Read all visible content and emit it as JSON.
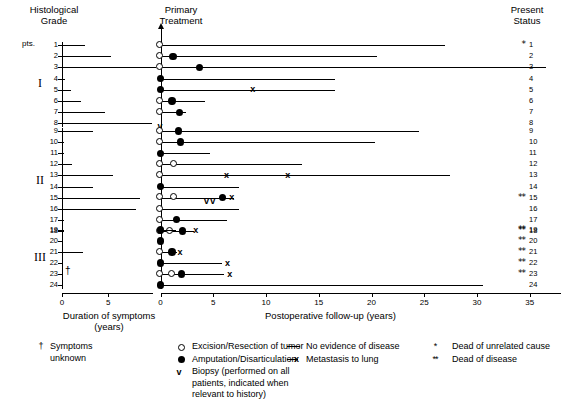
{
  "headers": {
    "histological_grade": "Histological\nGrade",
    "primary_treatment": "Primary\nTreatment",
    "present_status": "Present\nStatus"
  },
  "axes": {
    "left": {
      "title": "Duration of symptoms\n(years)",
      "ticks": [
        "0",
        "5"
      ],
      "tick_values": [
        0,
        5
      ],
      "max": 9.8,
      "unit": "years"
    },
    "bottom": {
      "title": "Postoperative follow-up (years)",
      "ticks": [
        "0",
        "5",
        "10",
        "15",
        "20",
        "25",
        "30",
        "35"
      ],
      "tick_values": [
        0,
        5,
        10,
        15,
        20,
        25,
        30,
        35
      ],
      "max": 38,
      "unit": "years"
    }
  },
  "pts_label": "pts.",
  "grades": [
    {
      "label": "I",
      "rows": [
        1,
        2,
        3,
        4,
        5,
        6,
        7,
        8
      ]
    },
    {
      "label": "II",
      "rows": [
        9,
        10,
        11,
        12,
        13,
        14,
        15,
        16,
        17,
        18
      ]
    },
    {
      "label": "III",
      "rows": [
        19,
        20,
        21,
        22,
        23,
        24
      ]
    }
  ],
  "legend": {
    "dagger": {
      "symbol": "†",
      "text": "Symptoms\nunknown"
    },
    "treatments": [
      {
        "symbol": "open-circle",
        "text": "Excision/Resection of tumor"
      },
      {
        "symbol": "filled-circle",
        "text": "Amputation/Disarticulation"
      },
      {
        "symbol": "v-glyph",
        "text": "Biopsy (performed on all\npatients, indicated when\nrelevant to history)"
      }
    ],
    "outcomes": [
      {
        "symbol": "solid-line",
        "text": "No evidence of disease"
      },
      {
        "symbol": "line-x",
        "text": "Metastasis to lung"
      }
    ],
    "status": [
      {
        "symbol": "*",
        "text": "Dead of unrelated cause"
      },
      {
        "symbol": "**",
        "text": "Dead of disease"
      }
    ]
  },
  "chart_data": {
    "type": "table",
    "xlabel": "Postoperative follow-up (years)",
    "ylabel": "Patient number",
    "xlim": [
      0,
      38
    ],
    "duration_xlim": [
      0,
      9.8
    ],
    "grid": false,
    "legend_position": "bottom",
    "patients": [
      {
        "pt": 1,
        "grade": "I",
        "duration_years": 2.5,
        "followup_years": 27.0,
        "treatments": [
          {
            "type": "open-circle",
            "year": 0.0
          }
        ],
        "metastasis_years": [],
        "status": "*",
        "symptoms_unknown": false
      },
      {
        "pt": 2,
        "grade": "I",
        "duration_years": 5.3,
        "followup_years": 20.5,
        "treatments": [
          {
            "type": "open-circle",
            "year": 0.0
          },
          {
            "type": "filled-circle",
            "year": 1.2
          }
        ],
        "metastasis_years": [],
        "status": "",
        "symptoms_unknown": false
      },
      {
        "pt": 3,
        "grade": "I",
        "duration_years": 10.2,
        "followup_years": 36.5,
        "treatments": [
          {
            "type": "open-circle",
            "year": 0.0
          },
          {
            "type": "filled-circle",
            "year": 3.7
          }
        ],
        "metastasis_years": [],
        "status": "",
        "symptoms_unknown": false
      },
      {
        "pt": 4,
        "grade": "I",
        "duration_years": 0.3,
        "followup_years": 16.5,
        "treatments": [
          {
            "type": "filled-circle",
            "year": 0.0
          }
        ],
        "metastasis_years": [],
        "status": "",
        "symptoms_unknown": false
      },
      {
        "pt": 5,
        "grade": "I",
        "duration_years": 1.0,
        "followup_years": 16.5,
        "treatments": [
          {
            "type": "filled-circle",
            "year": 0.0
          }
        ],
        "metastasis_years": [
          8.8
        ],
        "status": "",
        "symptoms_unknown": false
      },
      {
        "pt": 6,
        "grade": "I",
        "duration_years": 2.0,
        "followup_years": 4.2,
        "treatments": [
          {
            "type": "open-circle",
            "year": 0.0
          },
          {
            "type": "filled-circle",
            "year": 1.1
          }
        ],
        "metastasis_years": [],
        "status": "",
        "symptoms_unknown": false
      },
      {
        "pt": 7,
        "grade": "I",
        "duration_years": 4.6,
        "followup_years": 2.4,
        "treatments": [
          {
            "type": "open-circle",
            "year": 0.0
          },
          {
            "type": "filled-circle",
            "year": 1.8
          }
        ],
        "metastasis_years": [],
        "status": "",
        "symptoms_unknown": false
      },
      {
        "pt": 8,
        "grade": "I",
        "duration_years": 9.7,
        "followup_years": 0.0,
        "treatments": [
          {
            "type": "v-glyph",
            "year": 0.0
          }
        ],
        "metastasis_years": [],
        "status": "",
        "symptoms_unknown": false
      },
      {
        "pt": 9,
        "grade": "II",
        "duration_years": 3.3,
        "followup_years": 24.5,
        "treatments": [
          {
            "type": "open-circle",
            "year": 0.0
          },
          {
            "type": "filled-circle",
            "year": 1.7
          }
        ],
        "metastasis_years": [],
        "status": "",
        "symptoms_unknown": false
      },
      {
        "pt": 10,
        "grade": "II",
        "duration_years": 0.2,
        "followup_years": 20.3,
        "treatments": [
          {
            "type": "open-circle",
            "year": 0.0
          },
          {
            "type": "filled-circle",
            "year": 1.9
          }
        ],
        "metastasis_years": [],
        "status": "",
        "symptoms_unknown": false
      },
      {
        "pt": 11,
        "grade": "II",
        "duration_years": 0.2,
        "followup_years": 4.7,
        "treatments": [
          {
            "type": "filled-circle",
            "year": 0.0
          }
        ],
        "metastasis_years": [],
        "status": "",
        "symptoms_unknown": false
      },
      {
        "pt": 12,
        "grade": "II",
        "duration_years": 1.1,
        "followup_years": 13.4,
        "treatments": [
          {
            "type": "open-circle",
            "year": 0.0
          },
          {
            "type": "open-circle",
            "year": 1.3
          }
        ],
        "metastasis_years": [],
        "status": "",
        "symptoms_unknown": false
      },
      {
        "pt": 13,
        "grade": "II",
        "duration_years": 5.5,
        "followup_years": 27.4,
        "treatments": [
          {
            "type": "open-circle",
            "year": 0.0
          }
        ],
        "metastasis_years": [
          6.3,
          12.1
        ],
        "status": "",
        "symptoms_unknown": false
      },
      {
        "pt": 14,
        "grade": "II",
        "duration_years": 3.4,
        "followup_years": 7.4,
        "treatments": [
          {
            "type": "filled-circle",
            "year": 0.0
          }
        ],
        "metastasis_years": [],
        "status": "",
        "symptoms_unknown": false
      },
      {
        "pt": 15,
        "grade": "II",
        "duration_years": 8.4,
        "followup_years": 7.0,
        "treatments": [
          {
            "type": "open-circle",
            "year": 0.0
          },
          {
            "type": "open-circle",
            "year": 1.3
          },
          {
            "type": "v-glyph",
            "year": 4.4
          },
          {
            "type": "v-glyph",
            "year": 5.0
          },
          {
            "type": "filled-circle",
            "year": 5.9
          }
        ],
        "metastasis_years": [
          6.8
        ],
        "status": "**",
        "symptoms_unknown": false
      },
      {
        "pt": 16,
        "grade": "II",
        "duration_years": 8.0,
        "followup_years": 7.4,
        "treatments": [
          {
            "type": "open-circle",
            "year": 0.0
          }
        ],
        "metastasis_years": [],
        "status": "",
        "symptoms_unknown": false
      },
      {
        "pt": 17,
        "grade": "II",
        "duration_years": 0.2,
        "followup_years": 6.3,
        "treatments": [
          {
            "type": "open-circle",
            "year": 0.0
          },
          {
            "type": "filled-circle",
            "year": 1.5
          }
        ],
        "metastasis_years": [],
        "status": "",
        "symptoms_unknown": false
      },
      {
        "pt": 18,
        "grade": "II",
        "duration_years": 0.2,
        "followup_years": 3.2,
        "treatments": [
          {
            "type": "open-circle",
            "year": 0.0
          },
          {
            "type": "open-circle",
            "year": 0.9
          },
          {
            "type": "filled-circle",
            "year": 2.1
          }
        ],
        "metastasis_years": [
          3.4
        ],
        "status": "**",
        "symptoms_unknown": false
      },
      {
        "pt": 19,
        "grade": "III",
        "duration_years": 0.2,
        "followup_years": 1.5,
        "treatments": [
          {
            "type": "filled-circle",
            "year": 0.0
          }
        ],
        "metastasis_years": [],
        "status": "**",
        "symptoms_unknown": false
      },
      {
        "pt": 20,
        "grade": "III",
        "duration_years": 0.1,
        "followup_years": 0.0,
        "treatments": [
          {
            "type": "filled-circle",
            "year": 0.0
          }
        ],
        "metastasis_years": [],
        "status": "**",
        "symptoms_unknown": false
      },
      {
        "pt": 21,
        "grade": "III",
        "duration_years": 2.3,
        "followup_years": 1.6,
        "treatments": [
          {
            "type": "open-circle",
            "year": 0.0
          },
          {
            "type": "filled-circle",
            "year": 1.1
          }
        ],
        "metastasis_years": [
          1.9
        ],
        "status": "**",
        "symptoms_unknown": false
      },
      {
        "pt": 22,
        "grade": "III",
        "duration_years": 0.1,
        "followup_years": 5.8,
        "treatments": [
          {
            "type": "filled-circle",
            "year": 0.0
          }
        ],
        "metastasis_years": [
          6.4
        ],
        "status": "**",
        "symptoms_unknown": false
      },
      {
        "pt": 23,
        "grade": "III",
        "duration_years": 0.1,
        "followup_years": 6.0,
        "treatments": [
          {
            "type": "open-circle",
            "year": 0.0
          },
          {
            "type": "open-circle",
            "year": 1.1
          },
          {
            "type": "filled-circle",
            "year": 2.0
          }
        ],
        "metastasis_years": [
          6.6
        ],
        "status": "**",
        "symptoms_unknown": true
      },
      {
        "pt": 24,
        "grade": "III",
        "duration_years": 0.1,
        "followup_years": 30.6,
        "treatments": [
          {
            "type": "filled-circle",
            "year": 0.0
          }
        ],
        "metastasis_years": [],
        "status": "",
        "symptoms_unknown": false
      }
    ]
  }
}
